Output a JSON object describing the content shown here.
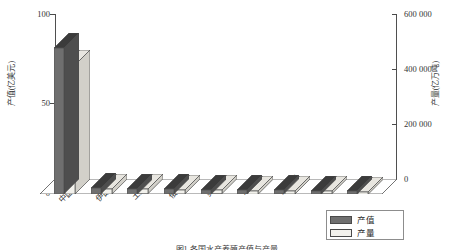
{
  "chart_data": {
    "type": "bar",
    "title": "",
    "categories": [
      "中国",
      "伊朗",
      "土耳其",
      "俄罗斯",
      "美国",
      "乌克兰",
      "西班牙",
      "埃及",
      "日本"
    ],
    "series": [
      {
        "name": "产值",
        "axis": "left",
        "unit": "亿美元",
        "values": [
          81,
          3.2,
          3.0,
          2.6,
          2.4,
          2.2,
          2.0,
          1.8,
          1.6
        ]
      },
      {
        "name": "产量",
        "axis": "right",
        "unit": "亿万吨",
        "values": [
          430000,
          17000,
          15500,
          13000,
          12000,
          11000,
          10000,
          9000,
          8000
        ]
      }
    ],
    "ylabel": "产值(亿美元)",
    "y2label": "产量(亿万吨)",
    "xlabel": "",
    "ylim": [
      0,
      100
    ],
    "y2lim": [
      0,
      600000
    ],
    "yticks": [
      "0",
      "50",
      "100"
    ],
    "y2ticks": [
      "0",
      "200 000",
      "400 000",
      "600 000"
    ],
    "grid": false,
    "legend_position": "bottom-right",
    "style": "3d-column"
  },
  "legend": {
    "items": [
      {
        "label": "产值",
        "color": "#6f6f6f"
      },
      {
        "label": "产量",
        "color": "#f2f1ec"
      }
    ]
  },
  "caption": {
    "text": "图1  各国水产养殖产值与产量"
  },
  "colors": {
    "series_value_front": "#6f6f6f",
    "series_value_side": "#4e4e4e",
    "series_value_top": "#3b3b3b",
    "series_output_front": "#f2f1ec",
    "series_output_side": "#d2d0c9",
    "series_output_top": "#e8e6e0",
    "axis": "#4f4f4f",
    "floor": "#ffffff",
    "text": "#2b2b2b"
  }
}
